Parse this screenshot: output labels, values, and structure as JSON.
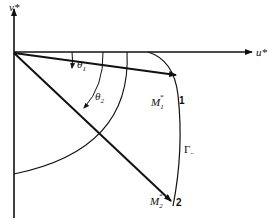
{
  "diagram": {
    "axes": {
      "horizontal_label": "u*",
      "vertical_label": "v*"
    },
    "angles": [
      {
        "label": "θ1",
        "base": "θ",
        "sub": "1"
      },
      {
        "label": "θ2",
        "base": "θ",
        "sub": "2"
      }
    ],
    "points": [
      {
        "label": "M1*",
        "base": "M",
        "sub": "1",
        "sup": "*",
        "number": "1"
      },
      {
        "label": "M2*",
        "base": "M",
        "sub": "2",
        "sup": "*",
        "number": "2"
      }
    ],
    "curve": {
      "label": "Γ−",
      "base": "Γ",
      "sub": "−"
    },
    "colors": {
      "stroke": "#111111",
      "background": "#ffffff"
    }
  }
}
